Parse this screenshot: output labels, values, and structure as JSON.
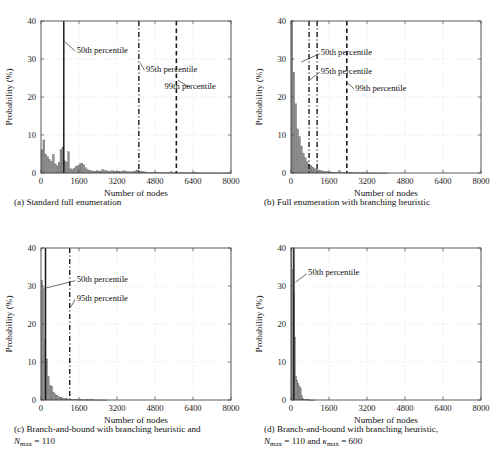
{
  "figure": {
    "panel_count": 4,
    "shared": {
      "xlabel": "Number of nodes",
      "ylabel": "Probability (%)",
      "xticks": [
        "0",
        "1600",
        "3200",
        "4800",
        "6400",
        "8000"
      ],
      "yticks": [
        "0",
        "10",
        "20",
        "30",
        "40"
      ],
      "xlim": [
        0,
        8000
      ],
      "ylim": [
        0,
        40
      ],
      "grid": true,
      "bar_color": "#8d8d8d",
      "line_color": "#1a1a1a"
    }
  },
  "chart_data": [
    {
      "id": "panel-a",
      "type": "bar",
      "title": "",
      "caption_prefix": "(a)",
      "caption_text": "Standard full enumeration",
      "xlabel": "Number of nodes",
      "ylabel": "Probability (%)",
      "xlim": [
        0,
        8000
      ],
      "ylim": [
        0,
        40
      ],
      "xticks": [
        0,
        1600,
        3200,
        4800,
        6400,
        8000
      ],
      "xticklabels": [
        "0",
        "1600",
        "3200",
        "4800",
        "6400",
        "8000"
      ],
      "yticks": [
        0,
        10,
        20,
        30,
        40
      ],
      "yticklabels": [
        "0",
        "10",
        "20",
        "30",
        "40"
      ],
      "grid": true,
      "bin_width": 80,
      "bin_starts": [
        0,
        80,
        160,
        240,
        320,
        400,
        480,
        560,
        640,
        720,
        800,
        880,
        960,
        1040,
        1120,
        1200,
        1280,
        1360,
        1440,
        1520,
        1600,
        1680,
        1760,
        1840,
        1920,
        2000,
        2080,
        2160,
        2240,
        2320,
        2400,
        2480,
        2560,
        2640,
        2720,
        2800,
        2880,
        2960,
        3040,
        3120,
        3200,
        3280,
        3360,
        3440,
        3520,
        3600,
        3680,
        3760,
        3840,
        3920,
        4000,
        4080,
        4160,
        4240,
        4320,
        4400,
        4480,
        4560,
        4640,
        4720,
        4800,
        4880,
        4960,
        5040,
        5120,
        5200,
        5280,
        5360,
        5440,
        5520,
        5600,
        5680,
        5760,
        5840,
        5920,
        6000,
        6080,
        6160,
        6240,
        6320,
        6400,
        6480,
        6560,
        6640,
        6720,
        6800,
        6880,
        6960,
        7040,
        7120,
        7200,
        7280,
        7360,
        7440,
        7520,
        7600,
        7680,
        7760,
        7840,
        7920
      ],
      "values": [
        6.1,
        8.7,
        5.0,
        4.3,
        3.6,
        3.1,
        4.9,
        2.4,
        1.9,
        2.8,
        6.2,
        6.8,
        3.2,
        2.9,
        5.6,
        1.1,
        1.0,
        1.3,
        1.8,
        1.9,
        2.4,
        2.6,
        2.2,
        1.4,
        1.0,
        0.7,
        0.6,
        0.5,
        0.5,
        0.6,
        0.5,
        0.5,
        0.9,
        0.7,
        0.6,
        0.5,
        0.5,
        0.6,
        0.5,
        0.4,
        0.3,
        0.3,
        0.4,
        0.6,
        0.5,
        0.4,
        0.3,
        0.3,
        0.4,
        0.5,
        0.8,
        0.6,
        0.5,
        0.4,
        0.3,
        0.25,
        0.2,
        0.2,
        0.2,
        0.2,
        0.15,
        0.15,
        0.12,
        0.12,
        0.1,
        0.1,
        0.1,
        0.1,
        0.35,
        0.1,
        0.08,
        0.08,
        0.08,
        0.06,
        0.06,
        0.06,
        0.05,
        0.05,
        0.05,
        0.05,
        0.04,
        0.04,
        0.04,
        0.03,
        0.03,
        0.03,
        0.03,
        0.02,
        0.02,
        0.02,
        0.02,
        0.02,
        0.02,
        0.01,
        0.01,
        0.01,
        0.01,
        0.01,
        0.01,
        0.01
      ],
      "percentile_lines": [
        {
          "label": "50th percentile",
          "x": 960,
          "style": "solid",
          "label_x": 1500,
          "label_y": 32.5,
          "leader_from_x": 1430,
          "leader_from_y": 32.1,
          "leader_to_x": 1000,
          "leader_to_y": 34.6
        },
        {
          "label": "95th percentile",
          "x": 4120,
          "style": "dashdot",
          "label_x": 4420,
          "label_y": 27.4,
          "leader_from_x": 4360,
          "leader_from_y": 27.0,
          "leader_to_x": 4180,
          "leader_to_y": 28.9
        },
        {
          "label": "99th percentile",
          "x": 5700,
          "style": "dashed",
          "label_x": 5200,
          "label_y": 22.9,
          "leader_from_x": 6280,
          "leader_from_y": 22.5,
          "leader_to_x": 5760,
          "leader_to_y": 24.4
        }
      ]
    },
    {
      "id": "panel-b",
      "type": "bar",
      "title": "",
      "caption_prefix": "(b)",
      "caption_text": "Full enumeration with branching heuristic",
      "xlabel": "Number of nodes",
      "ylabel": "Probability (%)",
      "xlim": [
        0,
        8000
      ],
      "ylim": [
        0,
        40
      ],
      "xticks": [
        0,
        1600,
        3200,
        4800,
        6400,
        8000
      ],
      "xticklabels": [
        "0",
        "1600",
        "3200",
        "4800",
        "6400",
        "8000"
      ],
      "yticks": [
        0,
        10,
        20,
        30,
        40
      ],
      "yticklabels": [
        "0",
        "10",
        "20",
        "30",
        "40"
      ],
      "grid": true,
      "bin_width": 80,
      "bin_starts": [
        0,
        80,
        160,
        240,
        320,
        400,
        480,
        560,
        640,
        720,
        800,
        880,
        960,
        1040,
        1120,
        1200,
        1280,
        1360,
        1440,
        1520,
        1600,
        1680,
        1760,
        1840,
        1920,
        2000,
        2080,
        2160,
        2240,
        2320,
        2400,
        2480,
        2560,
        2640,
        2720,
        2800,
        2880,
        2960,
        3040,
        3120,
        3200,
        3280,
        3360,
        3440,
        3520,
        3600,
        3680,
        3760,
        3840,
        3920,
        4000
      ],
      "values": [
        40.0,
        26.5,
        18.2,
        11.6,
        9.6,
        7.1,
        5.2,
        4.0,
        3.0,
        2.3,
        1.9,
        1.5,
        1.2,
        1.0,
        0.8,
        0.7,
        0.55,
        0.45,
        0.4,
        0.3,
        0.28,
        0.25,
        0.22,
        0.2,
        0.18,
        0.6,
        0.15,
        0.13,
        0.12,
        0.1,
        0.1,
        0.09,
        0.08,
        0.08,
        0.07,
        0.06,
        0.06,
        0.05,
        0.05,
        0.04,
        0.04,
        0.03,
        0.03,
        0.03,
        0.02,
        0.02,
        0.02,
        0.02,
        0.01,
        0.01,
        0.01
      ],
      "percentile_lines": [
        {
          "label": "50th percentile",
          "x": 760,
          "style": "dashdot",
          "label_x": 1250,
          "label_y": 31.8,
          "leader_from_x": 1210,
          "leader_from_y": 31.4,
          "leader_to_x": 430,
          "leader_to_y": 29.2
        },
        {
          "label": "95th percentile",
          "x": 1100,
          "style": "dashdot",
          "label_x": 1250,
          "label_y": 26.9,
          "leader_from_x": 1210,
          "leader_from_y": 26.5,
          "leader_to_x": 790,
          "leader_to_y": 24.5
        },
        {
          "label": "99th percentile",
          "x": 2350,
          "style": "dashed",
          "label_x": 2700,
          "label_y": 22.5,
          "leader_from_x": 2660,
          "leader_from_y": 22.1,
          "leader_to_x": 2400,
          "leader_to_y": 23.6
        }
      ]
    },
    {
      "id": "panel-c",
      "type": "bar",
      "title": "",
      "caption_prefix": "(c)",
      "caption_text": "Branch-and-bound with branching heuristic and",
      "caption_line2_math": "N",
      "caption_line2_sub": "max",
      "caption_line2_rest": " = 110",
      "xlabel": "Number of nodes",
      "ylabel": "Probability (%)",
      "xlim": [
        0,
        8000
      ],
      "ylim": [
        0,
        40
      ],
      "xticks": [
        0,
        1600,
        3200,
        4800,
        6400,
        8000
      ],
      "xticklabels": [
        "0",
        "1600",
        "3200",
        "4800",
        "6400",
        "8000"
      ],
      "yticks": [
        0,
        10,
        20,
        30,
        40
      ],
      "yticklabels": [
        "0",
        "10",
        "20",
        "30",
        "40"
      ],
      "grid": true,
      "bin_width": 70,
      "bin_starts": [
        0,
        70,
        140,
        210,
        280,
        350,
        420,
        490,
        560,
        630,
        700,
        770,
        840,
        910,
        980,
        1050,
        1120,
        1190,
        1260,
        1330,
        1400,
        1470,
        1540,
        1610,
        1680,
        1750,
        1820,
        1890,
        1960,
        2030,
        2100,
        2170,
        2240,
        2310,
        2380,
        2450,
        2520,
        2590,
        2660,
        2730
      ],
      "values": [
        31.5,
        29.6,
        16.0,
        10.8,
        6.2,
        3.9,
        3.6,
        2.1,
        1.6,
        1.3,
        1.0,
        0.75,
        0.6,
        0.45,
        0.35,
        0.3,
        0.25,
        0.2,
        0.18,
        0.15,
        0.13,
        0.12,
        0.1,
        0.09,
        0.08,
        0.07,
        0.06,
        0.06,
        0.05,
        0.05,
        0.04,
        0.04,
        0.03,
        0.03,
        0.03,
        0.02,
        0.02,
        0.02,
        0.01,
        0.01
      ],
      "percentile_lines": [
        {
          "label": "50th percentile",
          "x": 190,
          "style": "solid",
          "label_x": 1500,
          "label_y": 31.8,
          "leader_from_x": 1440,
          "leader_from_y": 31.4,
          "leader_to_x": 230,
          "leader_to_y": 29.5
        },
        {
          "label": "95th percentile",
          "x": 1210,
          "style": "dashdot",
          "label_x": 1500,
          "label_y": 26.9,
          "leader_from_x": 1440,
          "leader_from_y": 26.5,
          "leader_to_x": 1250,
          "leader_to_y": 24.4
        }
      ]
    },
    {
      "id": "panel-d",
      "type": "bar",
      "title": "",
      "caption_prefix": "(d)",
      "caption_text": "Branch-and-bound with branching heuristic,",
      "caption_line2_math": "N",
      "caption_line2_sub": "max",
      "caption_line2_rest": " = 110 and ",
      "caption_line2_math2": "κ",
      "caption_line2_sub2": "max",
      "caption_line2_rest2": " = 600",
      "xlabel": "Number of nodes",
      "ylabel": "Probability (%)",
      "xlim": [
        0,
        8000
      ],
      "ylim": [
        0,
        40
      ],
      "xticks": [
        0,
        1600,
        3200,
        4800,
        6400,
        8000
      ],
      "xticklabels": [
        "0",
        "1600",
        "3200",
        "4800",
        "6400",
        "8000"
      ],
      "yticks": [
        0,
        10,
        20,
        30,
        40
      ],
      "yticklabels": [
        "0",
        "10",
        "20",
        "30",
        "40"
      ],
      "grid": true,
      "bin_width": 48,
      "bin_starts": [
        0,
        48,
        96,
        144,
        192,
        240,
        288,
        336,
        384,
        432,
        480,
        528,
        576,
        624,
        672,
        720,
        768,
        816,
        864,
        912,
        960
      ],
      "values": [
        40.0,
        34.3,
        28.0,
        16.6,
        6.3,
        5.2,
        4.4,
        3.6,
        3.1,
        1.1,
        0.45,
        0.25,
        0.15,
        0.1,
        0.06,
        0.04,
        0.03,
        0.02,
        0.02,
        0.01,
        0.01
      ],
      "percentile_lines": [
        {
          "label": "50th percentile",
          "x": 120,
          "style": "solid",
          "label_x": 720,
          "label_y": 33.6,
          "leader_from_x": 660,
          "leader_from_y": 33.2,
          "leader_to_x": 190,
          "leader_to_y": 31.0
        }
      ]
    }
  ]
}
